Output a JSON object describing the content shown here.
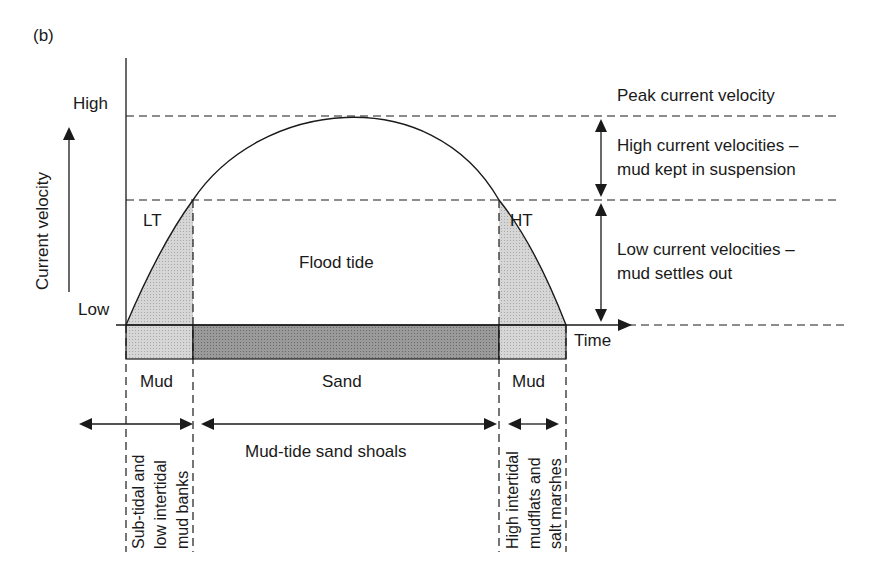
{
  "figure": {
    "panel_label": "(b)",
    "y_axis": {
      "title": "Current velocity",
      "high_label": "High",
      "low_label": "Low"
    },
    "x_axis": {
      "title": "Time"
    },
    "curve_labels": {
      "left": "LT",
      "right": "HT",
      "center": "Flood tide"
    },
    "threshold_annotations": {
      "peak": "Peak current velocity",
      "high_line1": "High current velocities –",
      "high_line2": "mud kept in suspension",
      "low_line1": "Low current velocities –",
      "low_line2": "mud settles out"
    },
    "sediment_bar": [
      {
        "label": "Mud",
        "fill": "#cfcfcf"
      },
      {
        "label": "Sand",
        "fill": "#8f8f8f"
      },
      {
        "label": "Mud",
        "fill": "#cfcfcf"
      }
    ],
    "environments": {
      "left_line1": "Sub-tidal and",
      "left_line2": "low intertidal",
      "left_line3": "mud banks",
      "center": "Mud-tide sand shoals",
      "right_line1": "High intertidal",
      "right_line2": "mudflats and",
      "right_line3": "salt marshes"
    },
    "colors": {
      "line": "#1a1a1a",
      "light_fill": "#cfcfcf",
      "dark_fill": "#8f8f8f"
    }
  }
}
